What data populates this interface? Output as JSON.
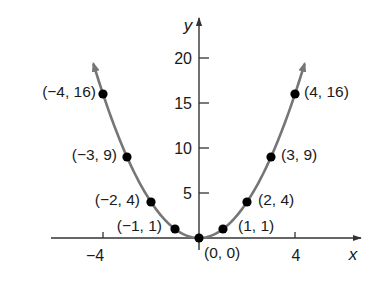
{
  "chart_data": {
    "type": "line",
    "title": "",
    "function": "y = x^2",
    "xlabel": "x",
    "ylabel": "y",
    "xlim": [
      -6.2,
      6.8
    ],
    "ylim": [
      0,
      24
    ],
    "x_ticks": [
      -4,
      4
    ],
    "x_tick_labels": [
      "−4",
      "4"
    ],
    "y_ticks": [
      5,
      10,
      15,
      20
    ],
    "y_tick_labels": [
      "5",
      "10",
      "15",
      "20"
    ],
    "grid": false,
    "legend": null,
    "curve": {
      "x_range": [
        -4.4,
        4.4
      ],
      "color": "#767676",
      "arrows_at_ends": true
    },
    "series": [
      {
        "name": "y = x^2 points",
        "points": [
          {
            "x": -4,
            "y": 16,
            "label": "(−4, 16)"
          },
          {
            "x": -3,
            "y": 9,
            "label": "(−3, 9)"
          },
          {
            "x": -2,
            "y": 4,
            "label": "(−2, 4)"
          },
          {
            "x": -1,
            "y": 1,
            "label": "(−1, 1)"
          },
          {
            "x": 0,
            "y": 0,
            "label": "(0, 0)"
          },
          {
            "x": 1,
            "y": 1,
            "label": "(1, 1)"
          },
          {
            "x": 2,
            "y": 4,
            "label": "(2, 4)"
          },
          {
            "x": 3,
            "y": 9,
            "label": "(3, 9)"
          },
          {
            "x": 4,
            "y": 16,
            "label": "(4, 16)"
          }
        ],
        "marker_color": "#000000"
      }
    ]
  },
  "axes": {
    "x_label": "x",
    "y_label": "y",
    "axis_color": "#333333"
  },
  "labels": {
    "tick_x_neg4": "−4",
    "tick_x_4": "4",
    "tick_y_5": "5",
    "tick_y_10": "10",
    "tick_y_15": "15",
    "tick_y_20": "20",
    "pt_neg4": "(−4, 16)",
    "pt_neg3": "(−3, 9)",
    "pt_neg2": "(−2, 4)",
    "pt_neg1": "(−1, 1)",
    "pt_0": "(0, 0)",
    "pt_1": "(1, 1)",
    "pt_2": "(2, 4)",
    "pt_3": "(3, 9)",
    "pt_4": "(4, 16)"
  }
}
